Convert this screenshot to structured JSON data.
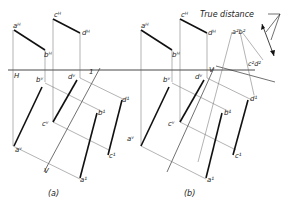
{
  "figure": {
    "panels": [
      {
        "id": "a",
        "caption": "(a)",
        "top_view_labels": {
          "a": "aᴴ",
          "b": "bᴴ",
          "c": "cᴴ",
          "d": "dᴴ"
        },
        "front_view_labels": {
          "a": "aᵛ",
          "b": "bᵛ",
          "c": "cᵛ",
          "d": "dᵛ"
        },
        "aux_view_labels": {
          "a": "a¹",
          "b": "b¹",
          "c": "c¹",
          "d": "d¹"
        },
        "fold_line_labels": {
          "H": "H",
          "V": "V",
          "one": "1",
          "V_aux": "V"
        }
      },
      {
        "id": "b",
        "caption": "(b)",
        "top_view_labels": {
          "a": "aᴴ",
          "b": "bᴴ",
          "c": "cᴴ",
          "d": "dᴴ"
        },
        "front_view_labels": {
          "a": "aᵛ",
          "b": "bᵛ",
          "c": "cᵛ",
          "d": "dᵛ"
        },
        "aux_view_labels": {
          "a": "a¹",
          "b": "b¹",
          "c": "c¹",
          "d": "d¹"
        },
        "aux2_labels": {
          "ab": "a²b²",
          "cd": "c²d²"
        },
        "fold_line_labels": {
          "V": "V"
        },
        "annotation": "True distance"
      }
    ]
  }
}
